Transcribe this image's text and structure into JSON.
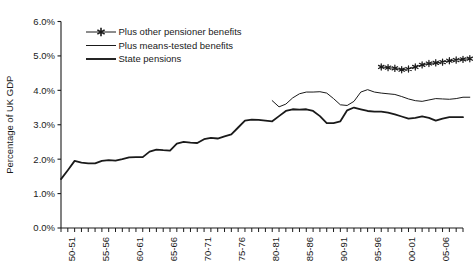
{
  "chart_data": {
    "type": "line",
    "title": "",
    "xlabel": "",
    "ylabel": "Percentage of UK GDP",
    "ylim": [
      0,
      6
    ],
    "ytick_labels": [
      "0.0%",
      "1.0%",
      "2.0%",
      "3.0%",
      "4.0%",
      "5.0%",
      "6.0%"
    ],
    "ytick_values": [
      0,
      1,
      2,
      3,
      4,
      5,
      6
    ],
    "grid": false,
    "legend_position": "top-left-inside",
    "x_start_year": 1948,
    "x_end_year": 2007,
    "x_tick_interval_years": 1,
    "xtick_labels": [
      "50-51",
      "55-56",
      "60-61",
      "65-66",
      "70-71",
      "75-76",
      "80-81",
      "85-86",
      "90-91",
      "95-96",
      "00-01",
      "05-06"
    ],
    "xtick_label_years": [
      1950,
      1955,
      1960,
      1965,
      1970,
      1975,
      1980,
      1985,
      1990,
      1995,
      2000,
      2005
    ],
    "series": [
      {
        "name": "State pensions",
        "marker": "none",
        "line_width": 1.8,
        "color": "#1a1a1a",
        "start_year": 1948,
        "values": [
          1.42,
          1.68,
          1.95,
          1.9,
          1.88,
          1.88,
          1.95,
          1.97,
          1.96,
          2.0,
          2.05,
          2.06,
          2.06,
          2.22,
          2.28,
          2.26,
          2.25,
          2.45,
          2.5,
          2.48,
          2.47,
          2.58,
          2.62,
          2.6,
          2.66,
          2.72,
          2.92,
          3.12,
          3.15,
          3.14,
          3.12,
          3.1,
          3.25,
          3.4,
          3.45,
          3.44,
          3.45,
          3.4,
          3.25,
          3.05,
          3.05,
          3.1,
          3.42,
          3.5,
          3.45,
          3.4,
          3.38,
          3.38,
          3.35,
          3.3,
          3.24,
          3.18,
          3.2,
          3.24,
          3.2,
          3.12,
          3.18,
          3.22,
          3.22,
          3.22
        ]
      },
      {
        "name": "Plus means-tested benefits",
        "marker": "none",
        "line_width": 1.0,
        "color": "#1a1a1a",
        "start_year": 1979,
        "values": [
          3.7,
          3.52,
          3.6,
          3.78,
          3.9,
          3.95,
          3.95,
          3.96,
          3.92,
          3.76,
          3.58,
          3.56,
          3.68,
          3.95,
          4.02,
          3.95,
          3.92,
          3.9,
          3.88,
          3.82,
          3.75,
          3.7,
          3.68,
          3.72,
          3.76,
          3.75,
          3.74,
          3.76,
          3.8,
          3.8
        ]
      },
      {
        "name": "Plus other pensioner benefits",
        "marker": "star",
        "line_width": 1.0,
        "color": "#1a1a1a",
        "start_year": 1995,
        "values": [
          4.68,
          4.66,
          4.64,
          4.6,
          4.62,
          4.68,
          4.74,
          4.78,
          4.8,
          4.82,
          4.86,
          4.88,
          4.9,
          4.92
        ]
      }
    ]
  },
  "legend": {
    "entries": [
      {
        "label": "Plus other pensioner benefits",
        "marker": "star"
      },
      {
        "label": "Plus means-tested benefits",
        "marker": "thin-line"
      },
      {
        "label": "State pensions",
        "marker": "thick-line"
      }
    ]
  },
  "colors": {
    "ink": "#1a1a1a",
    "background": "#ffffff"
  }
}
